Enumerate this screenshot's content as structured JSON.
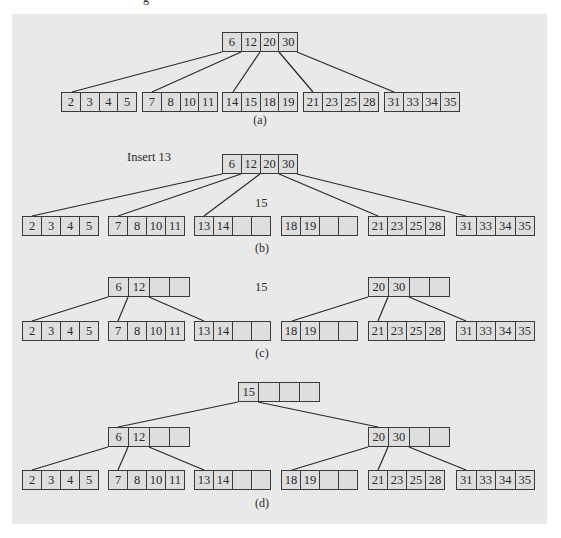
{
  "figure": {
    "top_cutoff_glyph": "g",
    "colors": {
      "panel_bg": "#e9e9e9",
      "cell_bg": "#dedede",
      "border": "#3a3a3a"
    },
    "panels": {
      "a": {
        "caption": "(a)",
        "root": [
          "6",
          "12",
          "20",
          "30"
        ],
        "leaves": [
          [
            "2",
            "3",
            "4",
            "5"
          ],
          [
            "7",
            "8",
            "10",
            "11"
          ],
          [
            "14",
            "15",
            "18",
            "19"
          ],
          [
            "21",
            "23",
            "25",
            "28"
          ],
          [
            "31",
            "33",
            "34",
            "35"
          ]
        ]
      },
      "b": {
        "caption": "(b)",
        "annotation": "Insert 13",
        "promoted_key": "15",
        "root": [
          "6",
          "12",
          "20",
          "30"
        ],
        "leaves": [
          [
            "2",
            "3",
            "4",
            "5"
          ],
          [
            "7",
            "8",
            "10",
            "11"
          ],
          [
            "13",
            "14",
            "",
            ""
          ],
          [
            "18",
            "19",
            "",
            ""
          ],
          [
            "21",
            "23",
            "25",
            "28"
          ],
          [
            "31",
            "33",
            "34",
            "35"
          ]
        ]
      },
      "c": {
        "caption": "(c)",
        "promoted_key": "15",
        "internal_left": [
          "6",
          "12",
          "",
          ""
        ],
        "internal_right": [
          "20",
          "30",
          "",
          ""
        ],
        "leaves": [
          [
            "2",
            "3",
            "4",
            "5"
          ],
          [
            "7",
            "8",
            "10",
            "11"
          ],
          [
            "13",
            "14",
            "",
            ""
          ],
          [
            "18",
            "19",
            "",
            ""
          ],
          [
            "21",
            "23",
            "25",
            "28"
          ],
          [
            "31",
            "33",
            "34",
            "35"
          ]
        ]
      },
      "d": {
        "caption": "(d)",
        "root": [
          "15",
          "",
          "",
          ""
        ],
        "internal_left": [
          "6",
          "12",
          "",
          ""
        ],
        "internal_right": [
          "20",
          "30",
          "",
          ""
        ],
        "leaves": [
          [
            "2",
            "3",
            "4",
            "5"
          ],
          [
            "7",
            "8",
            "10",
            "11"
          ],
          [
            "13",
            "14",
            "",
            ""
          ],
          [
            "18",
            "19",
            "",
            ""
          ],
          [
            "21",
            "23",
            "25",
            "28"
          ],
          [
            "31",
            "33",
            "34",
            "35"
          ]
        ]
      }
    }
  }
}
